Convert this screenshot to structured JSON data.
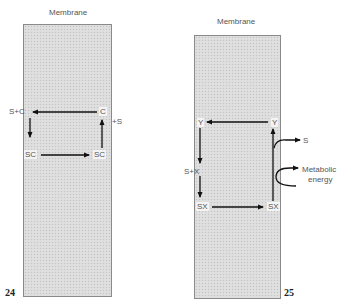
{
  "figures": [
    {
      "number": "24",
      "title": "Membrane",
      "nodes": {
        "top_left": "S+C",
        "top_right": "C",
        "bottom_left": "SC",
        "bottom_right": "SC"
      },
      "outside_label": "+S"
    },
    {
      "number": "25",
      "title": "Membrane",
      "nodes": {
        "top_left": "Y",
        "top_right": "Y",
        "mid_left": "S+X",
        "bottom_left": "SX",
        "bottom_right": "SX"
      },
      "outside_labels": {
        "released": "S",
        "energy": "Metabolic energy",
        "energy_line1": "Metabolic",
        "energy_line2": "energy"
      }
    }
  ],
  "colors": {
    "membrane_fill": "#dcdcdc",
    "border": "#8a8a8a",
    "arrow": "#111111"
  }
}
